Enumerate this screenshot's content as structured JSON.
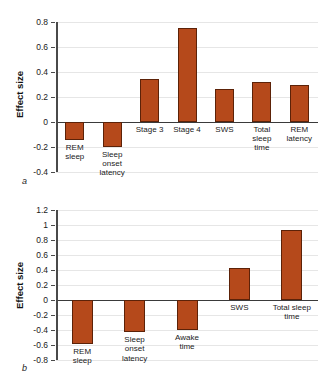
{
  "figure": {
    "panel_a_letter": "a",
    "panel_b_letter": "b",
    "bar_color": "#b5491b",
    "bar_edge_color": "#5c2208",
    "grid_color": "#e6e6e6",
    "axis_color": "#4a4a4a"
  },
  "chart_data": [
    {
      "type": "bar",
      "panel": "a",
      "title": "",
      "xlabel": "",
      "ylabel": "Effect size",
      "ylim": [
        -0.4,
        0.8
      ],
      "yticks": [
        -0.4,
        -0.2,
        0,
        0.2,
        0.4,
        0.6,
        0.8
      ],
      "ytick_labels": [
        "-0.4",
        "-0.2",
        "0",
        "0.2",
        "0.4",
        "0.6",
        "0.8"
      ],
      "grid": true,
      "legend": "none",
      "categories": [
        "REM\nsleep",
        "Sleep\nonset\nlatency",
        "Stage 3",
        "Stage 4",
        "SWS",
        "Total\nsleep\ntime",
        "REM\nlatency"
      ],
      "values": [
        -0.14,
        -0.2,
        0.345,
        0.755,
        0.265,
        0.32,
        0.3
      ]
    },
    {
      "type": "bar",
      "panel": "b",
      "title": "",
      "xlabel": "",
      "ylabel": "Effect size",
      "ylim": [
        -0.8,
        1.2
      ],
      "yticks": [
        -0.8,
        -0.6,
        -0.4,
        -0.2,
        0,
        0.2,
        0.4,
        0.6,
        0.8,
        1,
        1.2
      ],
      "ytick_labels": [
        "-0.8",
        "-0.6",
        "-0.4",
        "-0.2",
        "0",
        "0.2",
        "0.4",
        "0.6",
        "0.8",
        "1",
        "1.2"
      ],
      "grid": true,
      "legend": "none",
      "categories": [
        "REM\nsleep",
        "Sleep\nonset\nlatency",
        "Awake\ntime",
        "SWS",
        "Total sleep\ntime"
      ],
      "values": [
        -0.58,
        -0.43,
        -0.4,
        0.43,
        0.94
      ]
    }
  ]
}
